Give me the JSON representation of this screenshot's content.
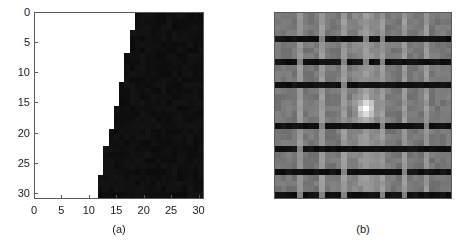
{
  "figure": {
    "type": "two-panel-figure",
    "background": "#ffffff",
    "width": 468,
    "height": 245
  },
  "panels": [
    {
      "id": "a",
      "caption": "(a)",
      "plot_type": "binary-image",
      "axes": {
        "x_ticks": [
          "0",
          "5",
          "10",
          "15",
          "20",
          "25",
          "30"
        ],
        "x_tick_values": [
          0,
          5,
          10,
          15,
          20,
          25,
          30
        ],
        "y_ticks": [
          "0",
          "5",
          "10",
          "15",
          "20",
          "25",
          "30"
        ],
        "y_tick_values": [
          0,
          5,
          10,
          15,
          20,
          25,
          30
        ],
        "xlim": [
          0,
          31
        ],
        "ylim": [
          0,
          31
        ],
        "y_direction": "reverse",
        "xlabel": "",
        "ylabel": ""
      },
      "colors": {
        "low": "#ffffff",
        "high": "#0b0b0b",
        "axis": "#5a5a5a"
      }
    },
    {
      "id": "b",
      "caption": "(b)",
      "plot_type": "grayscale-heatmap",
      "axes": {
        "x_ticks": [
          "0",
          "0.2",
          "0.4",
          "0.6",
          "0.8"
        ],
        "x_tick_values": [
          0,
          0.2,
          0.4,
          0.6,
          0.8
        ],
        "y_ticks": [
          "0",
          "0.1",
          "0.2",
          "0.3",
          "0.4",
          "0.5",
          "0.6",
          "0.7",
          "0.8",
          "0.9"
        ],
        "y_tick_values": [
          0,
          0.1,
          0.2,
          0.3,
          0.4,
          0.5,
          0.6,
          0.7,
          0.8,
          0.9
        ],
        "xlim": [
          0,
          1
        ],
        "ylim": [
          0,
          1
        ],
        "y_direction": "normal",
        "xlabel": "",
        "ylabel": ""
      },
      "colors": {
        "base_gray": "#787878",
        "dark_band": "#0a0a0a",
        "light_stripe": "#9a9a9a",
        "hotspot": "#e8e8e8",
        "axis": "#5a5a5a"
      }
    }
  ],
  "chart_data": [
    {
      "type": "heatmap",
      "panel": "a",
      "title": "(a)",
      "xlabel": "",
      "ylabel": "",
      "xlim": [
        0,
        31
      ],
      "ylim": [
        0,
        31
      ],
      "y_inverted": true,
      "grid": false,
      "legend": "none",
      "colormap": "gray-binary",
      "value_range": [
        0,
        1
      ],
      "nrows": 32,
      "ncols": 32,
      "description": "Binary image: value 0 (white) to the left of a monotonic staircase boundary, value 1 (black) to the right. Boundary column index by row.",
      "boundary_column_by_row": [
        19,
        19,
        19,
        18,
        18,
        18,
        18,
        17,
        17,
        17,
        17,
        17,
        16,
        16,
        16,
        16,
        15,
        15,
        15,
        15,
        14,
        14,
        14,
        13,
        13,
        13,
        13,
        13,
        12,
        12,
        12,
        12
      ]
    },
    {
      "type": "heatmap",
      "panel": "b",
      "title": "(b)",
      "xlabel": "",
      "ylabel": "",
      "xlim": [
        0,
        1
      ],
      "ylim": [
        0,
        1
      ],
      "y_inverted": false,
      "grid": false,
      "legend": "none",
      "colormap": "gray",
      "value_range": [
        0,
        1
      ],
      "nrows": 32,
      "ncols": 32,
      "description": "Grayscale magnitude map with periodic dark horizontal bands, periodic light vertical stripes, and a bright central hotspot at (0.5, 0.5).",
      "base_value": 0.47,
      "dark_band_value": 0.04,
      "light_stripe_value": 0.6,
      "hotspot_value": 0.91,
      "dark_band_y_positions": [
        0.0,
        0.125,
        0.25,
        0.385,
        0.625,
        0.75,
        0.875
      ],
      "light_stripe_x_positions": [
        0.125,
        0.25,
        0.375,
        0.5,
        0.625,
        0.75,
        0.875
      ],
      "hotspot_center": [
        0.5,
        0.5
      ]
    }
  ]
}
